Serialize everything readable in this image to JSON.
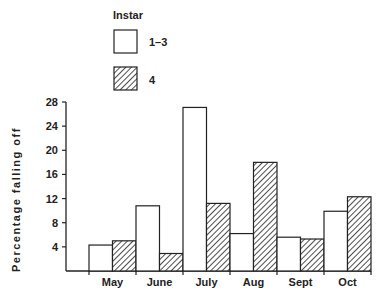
{
  "chart_data": {
    "type": "bar",
    "title": "",
    "xlabel": "",
    "ylabel": "Percentage falling off",
    "ylim": [
      0,
      28
    ],
    "yticks": [
      4,
      8,
      12,
      16,
      20,
      24,
      28
    ],
    "grid": false,
    "legend": {
      "title": "Instar",
      "position": "top-left",
      "entries": [
        "1–3",
        "4"
      ]
    },
    "categories": [
      "May",
      "June",
      "July",
      "Aug",
      "Sept",
      "Oct"
    ],
    "series": [
      {
        "name": "1–3",
        "pattern": "open",
        "values": [
          4.3,
          10.8,
          27.1,
          6.2,
          5.6,
          9.9
        ]
      },
      {
        "name": "4",
        "pattern": "hatched",
        "values": [
          5.0,
          2.9,
          11.2,
          18.0,
          5.3,
          12.3
        ]
      }
    ]
  },
  "colors": {
    "stroke": "#222222",
    "fill_open": "#ffffff",
    "hatch": "#222222"
  }
}
